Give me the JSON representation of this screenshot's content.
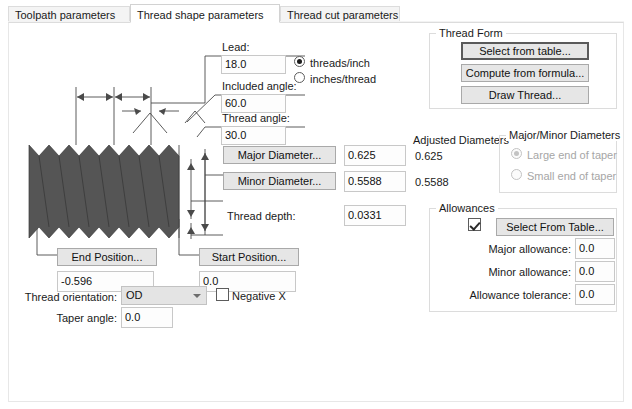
{
  "window": {
    "title": "Thread shape parameters"
  },
  "tabs": [
    {
      "label": "Toolpath parameters",
      "active": false
    },
    {
      "label": "Thread shape parameters",
      "active": true
    },
    {
      "label": "Thread cut parameters",
      "active": false
    }
  ],
  "lead": {
    "label": "Lead:",
    "value": "18.0",
    "units": [
      {
        "label": "threads/inch",
        "checked": true
      },
      {
        "label": "inches/thread",
        "checked": false
      }
    ]
  },
  "included_angle": {
    "label": "Included angle:",
    "value": "60.0"
  },
  "thread_angle": {
    "label": "Thread angle:",
    "value": "30.0"
  },
  "major_diameter": {
    "button": "Major Diameter...",
    "value": "0.625",
    "adjusted": "0.625"
  },
  "minor_diameter": {
    "button": "Minor Diameter...",
    "value": "0.5588",
    "adjusted": "0.5588"
  },
  "adjusted_diameters": {
    "title": "Adjusted Diameters"
  },
  "thread_depth": {
    "label": "Thread depth:",
    "value": "0.0331"
  },
  "end_position": {
    "button": "End Position...",
    "value": "-0.596"
  },
  "start_position": {
    "button": "Start Position...",
    "value": "0.0"
  },
  "thread_orientation": {
    "label": "Thread orientation:",
    "value": "OD",
    "options": [
      "OD",
      "ID"
    ]
  },
  "negative_x": {
    "label": "Negative X",
    "checked": false
  },
  "taper_angle": {
    "label": "Taper angle:",
    "value": "0.0"
  },
  "thread_form": {
    "title": "Thread Form",
    "buttons": [
      {
        "label": "Select from table...",
        "focused": true
      },
      {
        "label": "Compute from formula...",
        "focused": false
      },
      {
        "label": "Draw Thread...",
        "focused": false
      }
    ]
  },
  "major_minor_diameters": {
    "title": "Major/Minor Diameters",
    "enabled": false,
    "options": [
      {
        "label": "Large end of taper",
        "checked": true
      },
      {
        "label": "Small end of taper",
        "checked": false
      }
    ]
  },
  "allowances": {
    "title": "Allowances",
    "select_from_table": {
      "label": "Select From Table...",
      "checkbox_checked": true
    },
    "rows": [
      {
        "label": "Major allowance:",
        "value": "0.0"
      },
      {
        "label": "Minor allowance:",
        "value": "0.0"
      },
      {
        "label": "Allowance tolerance:",
        "value": "0.0"
      }
    ]
  },
  "diagram": {
    "name": "thread-profile-diagram",
    "thread_fill": "#555555",
    "line_color": "#4a4a4a"
  },
  "colors": {
    "button_face": "#e6e6e6",
    "field_bg": "#fdfdfd",
    "border": "#c8c8c8",
    "group_border": "#dcdcdc",
    "disabled_text": "#a6a6a6"
  }
}
